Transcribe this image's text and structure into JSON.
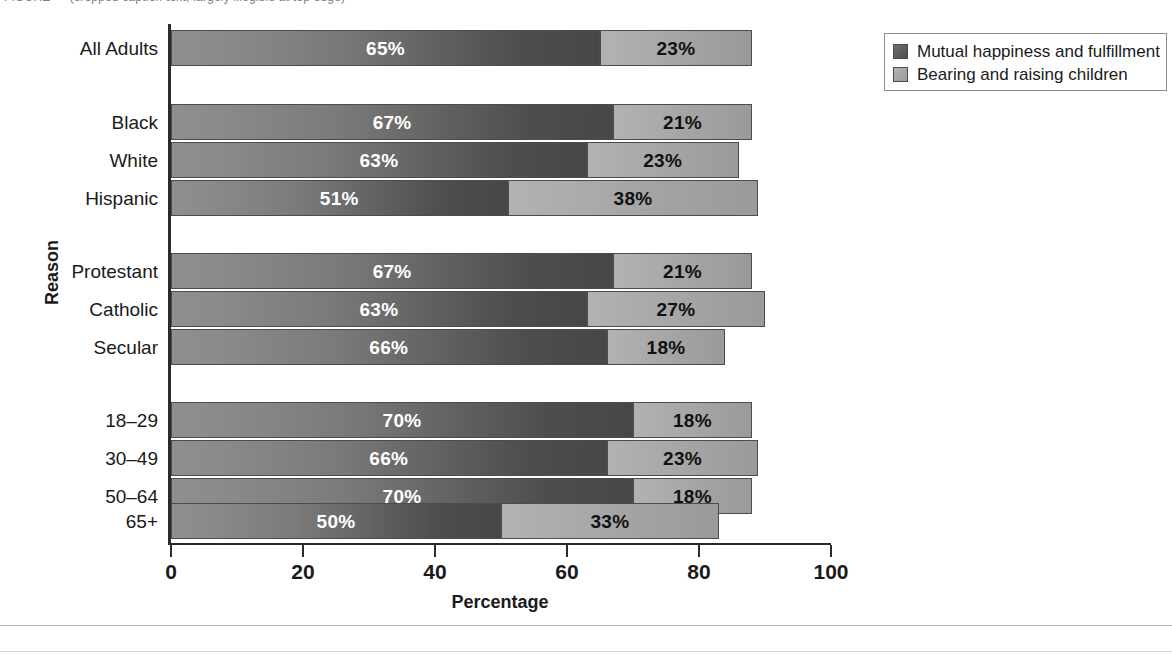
{
  "top_caption": "FIGURE — (cropped caption text, largely illegible at top edge)",
  "legend": {
    "entries": [
      {
        "label": "Mutual happiness and fulfillment",
        "color": "#5a5a5a",
        "key": "mutual"
      },
      {
        "label": "Bearing and raising children",
        "color": "#a8a8a8",
        "key": "children"
      }
    ]
  },
  "axes": {
    "x_title": "Percentage",
    "y_title": "Reason",
    "x_ticks": [
      "0",
      "20",
      "40",
      "60",
      "80",
      "100"
    ],
    "x_tick_values": [
      0,
      20,
      40,
      60,
      80,
      100
    ]
  },
  "chart_data": {
    "type": "bar",
    "orientation": "horizontal",
    "stacked": true,
    "title": "",
    "xlabel": "Percentage",
    "ylabel": "Reason",
    "xlim": [
      0,
      100
    ],
    "grid": false,
    "legend_position": "top-right",
    "legend": [
      "Mutual happiness and fulfillment",
      "Bearing and raising children"
    ],
    "categories": [
      "All Adults",
      "Black",
      "White",
      "Hispanic",
      "Protestant",
      "Catholic",
      "Secular",
      "18–29",
      "30–49",
      "50–64",
      "65+"
    ],
    "series": [
      {
        "name": "Mutual happiness and fulfillment",
        "color": "#5a5a5a",
        "values": [
          65,
          67,
          63,
          51,
          67,
          63,
          66,
          70,
          66,
          70,
          50
        ]
      },
      {
        "name": "Bearing and raising children",
        "color": "#a8a8a8",
        "values": [
          23,
          21,
          23,
          38,
          21,
          27,
          18,
          18,
          23,
          18,
          33
        ]
      }
    ],
    "data_labels": [
      {
        "category": "All Adults",
        "mutual": "65%",
        "children": "23%",
        "total": 88
      },
      {
        "category": "Black",
        "mutual": "67%",
        "children": "21%",
        "total": 88
      },
      {
        "category": "White",
        "mutual": "63%",
        "children": "23%",
        "total": 86
      },
      {
        "category": "Hispanic",
        "mutual": "51%",
        "children": "38%",
        "total": 89
      },
      {
        "category": "Protestant",
        "mutual": "67%",
        "children": "21%",
        "total": 88
      },
      {
        "category": "Catholic",
        "mutual": "63%",
        "children": "27%",
        "total": 90
      },
      {
        "category": "Secular",
        "mutual": "66%",
        "children": "18%",
        "total": 84
      },
      {
        "category": "18–29",
        "mutual": "70%",
        "children": "18%",
        "total": 88
      },
      {
        "category": "30–49",
        "mutual": "66%",
        "children": "23%",
        "total": 89
      },
      {
        "category": "50–64",
        "mutual": "70%",
        "children": "18%",
        "total": 88
      },
      {
        "category": "65+",
        "mutual": "50%",
        "children": "33%",
        "total": 83
      }
    ],
    "groups": [
      {
        "name": "overall",
        "categories": [
          "All Adults"
        ]
      },
      {
        "name": "race",
        "categories": [
          "Black",
          "White",
          "Hispanic"
        ]
      },
      {
        "name": "religion",
        "categories": [
          "Protestant",
          "Catholic",
          "Secular"
        ]
      },
      {
        "name": "age",
        "categories": [
          "18–29",
          "30–49",
          "50–64",
          "65+"
        ]
      }
    ]
  },
  "layout": {
    "plot_left_px": 171,
    "plot_right_px": 831,
    "px_per_unit": 6.6,
    "rows": [
      {
        "key": "all_adults",
        "top": 30
      },
      {
        "key": "black",
        "top": 104
      },
      {
        "key": "white",
        "top": 142
      },
      {
        "key": "hispanic",
        "top": 180
      },
      {
        "key": "protestant",
        "top": 253
      },
      {
        "key": "catholic",
        "top": 291
      },
      {
        "key": "secular",
        "top": 329
      },
      {
        "key": "age1829",
        "top": 402
      },
      {
        "key": "age3049",
        "top": 440
      },
      {
        "key": "age5064",
        "top": 478
      },
      {
        "key": "age65",
        "top": 503
      }
    ]
  }
}
